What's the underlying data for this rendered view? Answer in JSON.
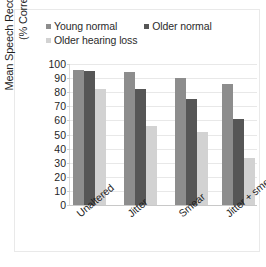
{
  "chart_data": {
    "type": "bar",
    "title": "",
    "xlabel": "",
    "ylabel_line1": "Mean Speech Recognition Score",
    "ylabel_line2": "(% Correct)",
    "categories": [
      "Unaltered",
      "Jitter",
      "Smear",
      "Jitter + smear"
    ],
    "series": [
      {
        "name": "Young normal",
        "color": "#8d8d8d",
        "values": [
          96,
          94,
          90,
          86
        ]
      },
      {
        "name": "Older normal",
        "color": "#565656",
        "values": [
          95,
          82,
          75,
          61
        ]
      },
      {
        "name": "Older hearing loss",
        "color": "#d2d2d2",
        "values": [
          82,
          56,
          52,
          33
        ]
      }
    ],
    "ylim": [
      0,
      100
    ],
    "yticks": [
      "100",
      "90",
      "80",
      "70",
      "60",
      "50",
      "40",
      "30",
      "20",
      "10",
      "0"
    ],
    "grid": true,
    "legend_position": "top"
  }
}
